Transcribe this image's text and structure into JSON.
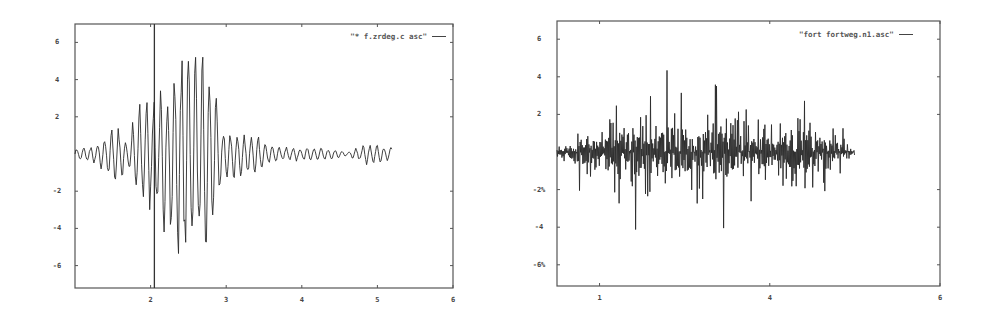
{
  "chart_data": [
    {
      "type": "line",
      "title": "",
      "legend": "\"*    f.zrdeg.c  asc\"",
      "legend_position": "top-right",
      "xlabel": "",
      "ylabel": "",
      "xlim": [
        1,
        6
      ],
      "ylim": [
        -7.1,
        7.1
      ],
      "grid": false,
      "x_ticks": [
        {
          "value": 2,
          "label": "2"
        },
        {
          "value": 3,
          "label": "3"
        },
        {
          "value": 4,
          "label": "4"
        },
        {
          "value": 5,
          "label": "5"
        },
        {
          "value": 6,
          "label": "6"
        }
      ],
      "y_ticks": [
        {
          "value": 6,
          "label": "6"
        },
        {
          "value": 4,
          "label": "4"
        },
        {
          "value": 2,
          "label": "2"
        },
        {
          "value": -2,
          "label": "-2"
        },
        {
          "value": -4,
          "label": "-4"
        },
        {
          "value": -6,
          "label": "-6"
        }
      ],
      "vertical_marker_x": 2.05,
      "series": [
        {
          "name": "f.zrdeg.c asc",
          "description": "Oscillating waveform, burst centred near x=2.0-2.4, peak amplitude ~6.3 up / -6.6 down, decaying after x=2.9, trace ends near x=5.2",
          "x_start": 1.0,
          "x_end": 5.2,
          "envelope": [
            {
              "x": 1.0,
              "max": 0.3,
              "min": -0.3
            },
            {
              "x": 1.3,
              "max": 0.5,
              "min": -0.6
            },
            {
              "x": 1.55,
              "max": 1.7,
              "min": -1.9
            },
            {
              "x": 1.7,
              "max": 0.6,
              "min": -0.8
            },
            {
              "x": 1.8,
              "max": 2.5,
              "min": -1.9
            },
            {
              "x": 1.95,
              "max": 3.3,
              "min": -3.4
            },
            {
              "x": 2.1,
              "max": 3.4,
              "min": -3.5
            },
            {
              "x": 2.25,
              "max": 4.0,
              "min": -5.2
            },
            {
              "x": 2.4,
              "max": 6.2,
              "min": -6.6
            },
            {
              "x": 2.55,
              "max": 6.2,
              "min": -6.0
            },
            {
              "x": 2.7,
              "max": 5.8,
              "min": -5.6
            },
            {
              "x": 2.85,
              "max": 4.3,
              "min": -4.3
            },
            {
              "x": 2.95,
              "max": 1.4,
              "min": -1.3
            },
            {
              "x": 3.2,
              "max": 1.2,
              "min": -1.5
            },
            {
              "x": 3.5,
              "max": 0.9,
              "min": -0.8
            },
            {
              "x": 3.7,
              "max": 0.4,
              "min": -0.4
            },
            {
              "x": 4.0,
              "max": 0.4,
              "min": -0.4
            },
            {
              "x": 4.4,
              "max": 0.3,
              "min": -0.3
            },
            {
              "x": 4.6,
              "max": 0.1,
              "min": -0.1
            },
            {
              "x": 4.85,
              "max": 0.6,
              "min": -0.6
            },
            {
              "x": 5.2,
              "max": 0.4,
              "min": -0.4
            }
          ]
        }
      ]
    },
    {
      "type": "line",
      "title": "",
      "legend": "\"fort fortweg.n1.asc\"",
      "legend_position": "top-right",
      "xlabel": "",
      "ylabel": "",
      "xlim": [
        1.5,
        6
      ],
      "ylim": [
        -7.1,
        7.1
      ],
      "grid": false,
      "x_ticks": [
        {
          "value": 2,
          "label": "1"
        },
        {
          "value": 4,
          "label": "4"
        },
        {
          "value": 6,
          "label": "6"
        }
      ],
      "y_ticks": [
        {
          "value": 6,
          "label": "6"
        },
        {
          "value": 4,
          "label": "4"
        },
        {
          "value": 2,
          "label": "2"
        },
        {
          "value": -2,
          "label": "-2%"
        },
        {
          "value": -4,
          "label": "-4"
        },
        {
          "value": -6,
          "label": "-6%"
        }
      ],
      "series": [
        {
          "name": "fort fortweg.n1.asc",
          "description": "Noisy broadband waveform, spikes up to ~5.4 near x=2.9 and down to ~-4.6 at x=2.5, 3.5, 4.5; trace ends near x=5.0",
          "x_start": 1.5,
          "x_end": 5.0,
          "envelope": [
            {
              "x": 1.5,
              "max": 0.2,
              "min": -0.3
            },
            {
              "x": 1.8,
              "max": 1.5,
              "min": -2.3
            },
            {
              "x": 2.0,
              "max": 2.0,
              "min": -2.2
            },
            {
              "x": 2.2,
              "max": 3.5,
              "min": -3.0
            },
            {
              "x": 2.5,
              "max": 3.3,
              "min": -4.6
            },
            {
              "x": 2.7,
              "max": 3.2,
              "min": -3.8
            },
            {
              "x": 2.85,
              "max": 5.4,
              "min": -3.5
            },
            {
              "x": 3.1,
              "max": 3.0,
              "min": -3.5
            },
            {
              "x": 3.3,
              "max": 4.0,
              "min": -3.7
            },
            {
              "x": 3.5,
              "max": 3.8,
              "min": -4.6
            },
            {
              "x": 3.8,
              "max": 2.4,
              "min": -2.6
            },
            {
              "x": 4.0,
              "max": 3.0,
              "min": -2.5
            },
            {
              "x": 4.2,
              "max": 3.4,
              "min": -3.2
            },
            {
              "x": 4.35,
              "max": 3.2,
              "min": -3.6
            },
            {
              "x": 4.5,
              "max": 2.8,
              "min": -4.6
            },
            {
              "x": 4.75,
              "max": 2.0,
              "min": -1.5
            },
            {
              "x": 5.0,
              "max": 0.4,
              "min": -0.4
            }
          ]
        }
      ]
    }
  ]
}
